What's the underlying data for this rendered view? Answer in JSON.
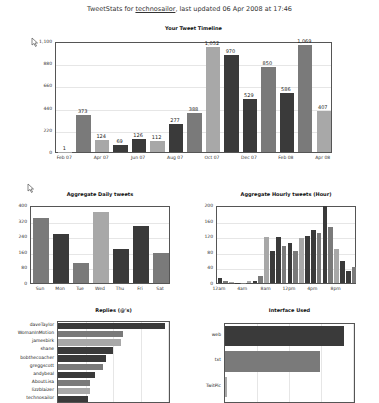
{
  "header": {
    "prefix": "TweetStats for ",
    "username": "technosailor",
    "suffix": ", last updated 06 Apr 2008 at 17:46"
  },
  "colors": {
    "dark": "#3a3a3a",
    "mid": "#7a7a7a",
    "light": "#a8a8a8",
    "frame": "#555555",
    "grid": "#e6e6e6"
  },
  "chart_data": [
    {
      "id": "timeline",
      "type": "bar",
      "title": "Your Tweet Timeline",
      "categories": [
        "Feb 07",
        "Mar 07",
        "Apr 07",
        "May 07",
        "Jun 07",
        "Jul 07",
        "Aug 07",
        "Sep 07",
        "Oct 07",
        "Nov 07",
        "Dec 07",
        "Jan 08",
        "Feb 08",
        "Mar 08",
        "Apr 08"
      ],
      "values": [
        1,
        373,
        124,
        69,
        126,
        112,
        277,
        388,
        1052,
        970,
        529,
        850,
        586,
        1069,
        407
      ],
      "value_labels": [
        "1",
        "373",
        "124",
        "69",
        "126",
        "112",
        "277",
        "388",
        "1,052",
        "970",
        "529",
        "850",
        "586",
        "1,069",
        "407"
      ],
      "x_tick_labels": [
        "Feb 07",
        "Apr 07",
        "Jun 07",
        "Aug 07",
        "Oct 07",
        "Dec 07",
        "Feb 08",
        "Apr 08"
      ],
      "y_ticks": [
        "0",
        "220",
        "440",
        "660",
        "880",
        "1,100"
      ],
      "ylim": [
        0,
        1100
      ],
      "grid": true,
      "xlabel": "",
      "ylabel": ""
    },
    {
      "id": "daily",
      "type": "bar",
      "title": "Aggregate Daily tweets",
      "categories": [
        "Sun",
        "Mon",
        "Tue",
        "Wed",
        "Thu",
        "Fri",
        "Sat"
      ],
      "values": [
        340,
        255,
        105,
        370,
        175,
        295,
        155
      ],
      "y_ticks": [
        "0",
        "80",
        "160",
        "240",
        "320",
        "400"
      ],
      "ylim": [
        0,
        400
      ],
      "grid": true
    },
    {
      "id": "hourly",
      "type": "bar",
      "title": "Aggregate Hourly tweets (Hour)",
      "categories": [
        "12am",
        "1am",
        "2am",
        "3am",
        "4am",
        "5am",
        "6am",
        "7am",
        "8am",
        "9am",
        "10am",
        "11am",
        "12pm",
        "1pm",
        "2pm",
        "3pm",
        "4pm",
        "5pm",
        "6pm",
        "7pm",
        "8pm",
        "9pm",
        "10pm",
        "11pm"
      ],
      "values": [
        14,
        6,
        3,
        1,
        1,
        4,
        6,
        18,
        120,
        84,
        119,
        96,
        103,
        83,
        118,
        123,
        139,
        131,
        200,
        145,
        89,
        57,
        30,
        42
      ],
      "x_tick_labels": [
        "12am",
        "4am",
        "8am",
        "12pm",
        "4pm",
        "8pm"
      ],
      "y_ticks": [
        "0",
        "40",
        "80",
        "120",
        "160",
        "200"
      ],
      "ylim": [
        0,
        200
      ],
      "grid": true
    },
    {
      "id": "replies",
      "type": "bar",
      "orientation": "horizontal",
      "title": "Replies (@'s)",
      "categories": [
        "daveTaylor",
        "WomanInMotion",
        "jamesbirk",
        "shane",
        "bobthecoacher",
        "greggscott",
        "andybeal",
        "AboutLisa",
        "lizzblaizer",
        "technosailor"
      ],
      "values": [
        100,
        61,
        59,
        51,
        45,
        42,
        35,
        30,
        30,
        28
      ],
      "grid": true
    },
    {
      "id": "interface",
      "type": "bar",
      "orientation": "horizontal",
      "title": "Interface Used",
      "categories": [
        "web",
        "txt",
        "TwitPic"
      ],
      "values": [
        95,
        76,
        1
      ],
      "grid": true
    }
  ]
}
